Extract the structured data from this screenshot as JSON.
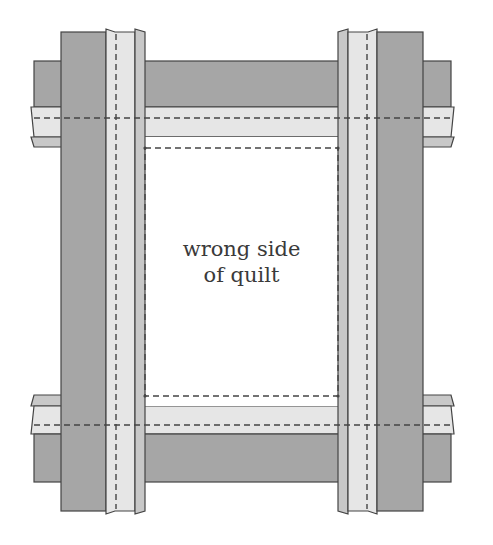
{
  "diagram": {
    "label": {
      "line1": "wrong side",
      "line2": "of quilt"
    },
    "colors": {
      "dark_band": "#a6a6a6",
      "light_strip": "#e6e6e6",
      "narrow_strip": "#c8c8c8",
      "outline": "#444444",
      "stitch": "#444444",
      "center": "#ffffff"
    },
    "parts": [
      "top-horizontal-band",
      "bottom-horizontal-band",
      "left-vertical-band",
      "right-vertical-band",
      "center-quilt-area",
      "stitching-lines"
    ]
  }
}
